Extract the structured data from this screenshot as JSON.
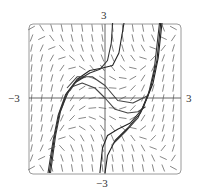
{
  "chart_data": {
    "type": "line",
    "subtype": "slope_field_with_solution_curves",
    "title": "",
    "xlabel": "",
    "ylabel": "",
    "xlim": [
      -3,
      3
    ],
    "ylim": [
      -3,
      3
    ],
    "grid": false,
    "legend": null,
    "axis_labels": {
      "x_min": "−3",
      "x_max": "3",
      "y_min": "−3",
      "y_max": "3"
    },
    "slope_field": {
      "grid_step": 0.4,
      "segment_length": 0.3,
      "color": "#555555"
    },
    "series": [
      {
        "name": "solution-1",
        "color": "#222222",
        "points": [
          [
            -2.2,
            -3
          ],
          [
            -2.0,
            -1.6
          ],
          [
            -1.8,
            -0.6
          ],
          [
            -1.5,
            0.2
          ],
          [
            -1.1,
            0.75
          ],
          [
            -0.6,
            1.1
          ],
          [
            -0.1,
            1.2
          ],
          [
            0.3,
            1.3
          ],
          [
            0.55,
            1.8
          ],
          [
            0.75,
            3
          ]
        ]
      },
      {
        "name": "solution-2",
        "color": "#333333",
        "points": [
          [
            -2.15,
            -3
          ],
          [
            -1.95,
            -1.5
          ],
          [
            -1.75,
            -0.5
          ],
          [
            -1.45,
            0.25
          ],
          [
            -1.1,
            0.7
          ],
          [
            -0.6,
            1.0
          ],
          [
            -0.2,
            1.15
          ],
          [
            0.1,
            1.5
          ],
          [
            0.25,
            2.2
          ],
          [
            0.3,
            3
          ]
        ]
      },
      {
        "name": "solution-3",
        "color": "#444444",
        "points": [
          [
            -1.6,
            0.0
          ],
          [
            -1.3,
            0.45
          ],
          [
            -0.9,
            0.6
          ],
          [
            -0.4,
            0.4
          ],
          [
            0.0,
            0.0
          ],
          [
            0.4,
            -0.45
          ],
          [
            0.9,
            -0.6
          ],
          [
            1.3,
            -0.55
          ],
          [
            1.6,
            -0.35
          ]
        ]
      },
      {
        "name": "solution-4",
        "color": "#444444",
        "points": [
          [
            -1.5,
            0.4
          ],
          [
            -1.1,
            0.85
          ],
          [
            -0.5,
            0.85
          ],
          [
            0.0,
            0.5
          ],
          [
            0.5,
            -0.1
          ],
          [
            1.1,
            -0.2
          ],
          [
            1.7,
            0.1
          ]
        ]
      },
      {
        "name": "solution-5",
        "color": "#222222",
        "points": [
          [
            -0.2,
            -3
          ],
          [
            -0.1,
            -2.0
          ],
          [
            0.1,
            -1.5
          ],
          [
            0.5,
            -1.25
          ],
          [
            1.0,
            -1.0
          ],
          [
            1.5,
            -0.4
          ],
          [
            1.9,
            0.6
          ],
          [
            2.1,
            1.6
          ],
          [
            2.25,
            3
          ]
        ]
      },
      {
        "name": "solution-6",
        "color": "#222222",
        "points": [
          [
            0.0,
            -3
          ],
          [
            0.1,
            -2.3
          ],
          [
            0.4,
            -1.7
          ],
          [
            0.9,
            -1.2
          ],
          [
            1.4,
            -0.6
          ],
          [
            1.8,
            0.4
          ],
          [
            2.05,
            1.5
          ],
          [
            2.2,
            3
          ]
        ]
      },
      {
        "name": "solution-7",
        "color": "#333333",
        "points": [
          [
            0.3,
            -1.85
          ],
          [
            0.8,
            -1.35
          ],
          [
            1.3,
            -0.8
          ],
          [
            1.7,
            0.1
          ],
          [
            1.95,
            1.2
          ],
          [
            2.15,
            3
          ]
        ]
      },
      {
        "name": "solution-8",
        "color": "#333333",
        "points": [
          [
            -2.25,
            -3
          ],
          [
            -2.05,
            -1.7
          ],
          [
            -1.85,
            -0.7
          ],
          [
            -1.55,
            0.15
          ],
          [
            -1.2,
            0.6
          ],
          [
            -0.8,
            0.85
          ]
        ]
      }
    ]
  },
  "colors": {
    "frame": "#9a9a9a",
    "axis": "#555555",
    "field": "#555555",
    "curve": "#222222"
  }
}
